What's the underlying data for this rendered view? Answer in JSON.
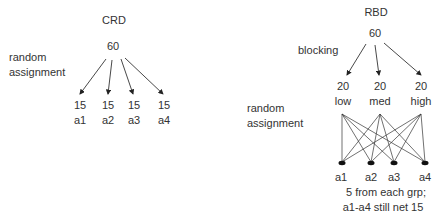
{
  "crd": {
    "title": "CRD",
    "total": "60",
    "side_label_line1": "random",
    "side_label_line2": "assignment",
    "groups": [
      {
        "n": "15",
        "label": "a1"
      },
      {
        "n": "15",
        "label": "a2"
      },
      {
        "n": "15",
        "label": "a3"
      },
      {
        "n": "15",
        "label": "a4"
      }
    ]
  },
  "rbd": {
    "title": "RBD",
    "total": "60",
    "blocking_label": "blocking",
    "blocks": [
      {
        "n": "20",
        "label": "low"
      },
      {
        "n": "20",
        "label": "med"
      },
      {
        "n": "20",
        "label": "high"
      }
    ],
    "side_label_line1": "random",
    "side_label_line2": "assignment",
    "treatments": [
      "a1",
      "a2",
      "a3",
      "a4"
    ],
    "note_line1": "5 from each grp;",
    "note_line2": "a1-a4 still net 15"
  }
}
